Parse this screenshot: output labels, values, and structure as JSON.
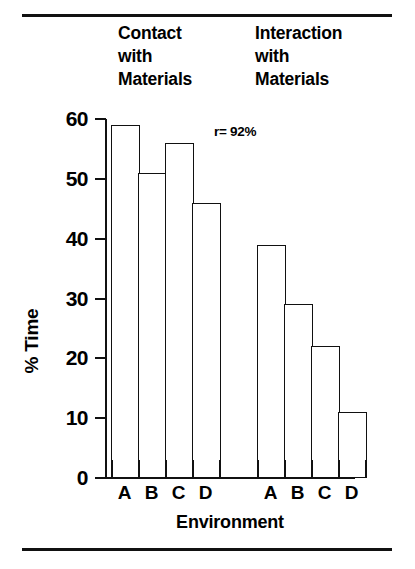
{
  "headings": {
    "contact": [
      "Contact",
      "with",
      "Materials"
    ],
    "interaction": [
      "Interaction",
      "with",
      "Materials"
    ]
  },
  "annotation": "r= 92%",
  "axis": {
    "ylabel": "% Time",
    "xlabel": "Environment",
    "yticks": [
      "60",
      "50",
      "40",
      "30",
      "20",
      "10",
      "0"
    ]
  },
  "chart_data": {
    "type": "bar",
    "title": "",
    "xlabel": "Environment",
    "ylabel": "% Time",
    "ylim": [
      0,
      60
    ],
    "yticks": [
      0,
      10,
      20,
      30,
      40,
      50,
      60
    ],
    "grid": false,
    "legend": "none",
    "annotations": [
      "r= 92%"
    ],
    "categories": [
      "A",
      "B",
      "C",
      "D"
    ],
    "groups": [
      {
        "name": "Contact with Materials",
        "categories": [
          "A",
          "B",
          "C",
          "D"
        ],
        "values": [
          59,
          51,
          56,
          46
        ]
      },
      {
        "name": "Interaction with Materials",
        "categories": [
          "A",
          "B",
          "C",
          "D"
        ],
        "values": [
          39,
          29,
          22,
          11
        ]
      }
    ],
    "bar_style": {
      "fill": "#ffffff",
      "edge": "#111111",
      "adjacent": true
    }
  }
}
